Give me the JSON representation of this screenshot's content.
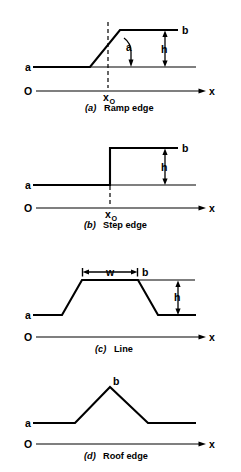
{
  "figure": {
    "background_color": "#ffffff",
    "stroke_color": "#000000",
    "panels": [
      {
        "id": "a",
        "index_label": "(a)",
        "caption": "Ramp edge",
        "caption_full": "(a) Ramp edge",
        "labels": {
          "low_level": "a",
          "high_level": "b",
          "height": "h",
          "angle": "a",
          "origin": "O",
          "axis": "x",
          "position": "x",
          "position_subscript": "O"
        },
        "geometry": {
          "baseline_y": 67,
          "top_y": 30,
          "axis_y": 91,
          "ramp_start_x": 90,
          "ramp_end_x": 120,
          "dashed_x": 108,
          "profile_left_x": 33,
          "profile_right_x": 196,
          "axis_left_x": 33,
          "axis_right_x": 205,
          "height_marker_x": 165
        }
      },
      {
        "id": "b",
        "index_label": "(b)",
        "caption": "Step edge",
        "caption_full": "(b) Step edge",
        "labels": {
          "low_level": "a",
          "high_level": "b",
          "height": "h",
          "origin": "O",
          "axis": "x",
          "position": "x",
          "position_subscript": "O"
        },
        "geometry": {
          "baseline_y": 185,
          "top_y": 148,
          "axis_y": 208,
          "step_x": 110,
          "dashed_x": 110,
          "profile_left_x": 33,
          "profile_right_x": 196,
          "axis_left_x": 33,
          "axis_right_x": 205,
          "height_marker_x": 165
        }
      },
      {
        "id": "c",
        "index_label": "(c)",
        "caption": "Line",
        "caption_full": "(c) Line",
        "labels": {
          "low_level": "a",
          "high_level": "b",
          "height": "h",
          "width": "w",
          "origin": "O",
          "axis": "x"
        },
        "geometry": {
          "baseline_y": 315,
          "top_y": 280,
          "axis_y": 337,
          "rise_start_x": 62,
          "top_left_x": 82,
          "top_right_x": 138,
          "fall_end_x": 158,
          "width_marker_y": 272,
          "profile_left_x": 33,
          "profile_right_x": 196,
          "axis_left_x": 33,
          "axis_right_x": 205,
          "height_marker_x": 178,
          "reference_right_x": 195
        }
      },
      {
        "id": "d",
        "index_label": "(d)",
        "caption": "Roof edge",
        "caption_full": "(d) Roof edge",
        "labels": {
          "low_level": "a",
          "peak": "b",
          "origin": "O",
          "axis": "x"
        },
        "geometry": {
          "baseline_y": 423,
          "peak_y": 387,
          "peak_x": 110,
          "axis_y": 444,
          "rise_start_x": 75,
          "fall_end_x": 148,
          "profile_left_x": 33,
          "profile_right_x": 196,
          "axis_left_x": 33,
          "axis_right_x": 205
        }
      }
    ]
  }
}
